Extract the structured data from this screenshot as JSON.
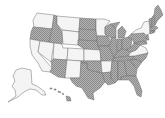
{
  "map": {
    "type": "us-states-choropleth",
    "categories": [
      {
        "key": "on",
        "pattern": "hatched",
        "color": "#9a9a9a"
      },
      {
        "key": "off",
        "pattern": "plain",
        "color": "#f4f4f4"
      }
    ],
    "border_color": "#6e6e6e",
    "states": {
      "WA": "off",
      "OR": "on",
      "CA": "off",
      "NV": "off",
      "ID": "on",
      "MT": "off",
      "WY": "off",
      "UT": "off",
      "AZ": "on",
      "CO": "off",
      "NM": "off",
      "ND": "on",
      "SD": "on",
      "NE": "on",
      "KS": "off",
      "OK": "on",
      "TX": "on",
      "MN": "off",
      "IA": "on",
      "MO": "on",
      "AR": "off",
      "LA": "on",
      "WI": "on",
      "IL": "on",
      "MI": "on",
      "IN": "on",
      "OH": "on",
      "KY": "on",
      "TN": "on",
      "MS": "on",
      "AL": "on",
      "GA": "on",
      "FL": "on",
      "SC": "on",
      "NC": "on",
      "VA": "off",
      "WV": "on",
      "PA": "on",
      "NY": "off",
      "MD": "on",
      "DE": "on",
      "NJ": "on",
      "CT": "on",
      "RI": "on",
      "MA": "on",
      "VT": "on",
      "NH": "on",
      "ME": "on",
      "AK": "off",
      "HI": "on"
    }
  }
}
